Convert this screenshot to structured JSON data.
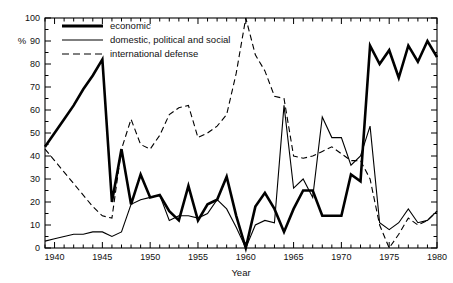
{
  "chart_data": {
    "type": "line",
    "title": "",
    "xlabel": "Year",
    "ylabel": "%",
    "xlim": [
      1939,
      1980
    ],
    "ylim": [
      0,
      100
    ],
    "grid": false,
    "legend_position": "top-left",
    "x_ticks": [
      1940,
      1945,
      1950,
      1955,
      1960,
      1965,
      1970,
      1975,
      1980
    ],
    "x_tick_labels": [
      "1940",
      "1945",
      "1950",
      "1955",
      "1960",
      "1965",
      "1970",
      "1975",
      "1980"
    ],
    "x_minor_step": 1,
    "y_ticks": [
      0,
      10,
      20,
      30,
      40,
      50,
      60,
      70,
      80,
      90,
      100
    ],
    "y_tick_labels": [
      "0",
      "10",
      "20",
      "30",
      "40",
      "50",
      "60",
      "70",
      "80",
      "90",
      "100"
    ],
    "series": [
      {
        "name": "economic",
        "style": "solid",
        "width": 2.6,
        "color": "#000000",
        "x": [
          1939,
          1940,
          1941,
          1942,
          1943,
          1944,
          1945,
          1946,
          1947,
          1948,
          1949,
          1950,
          1951,
          1952,
          1953,
          1954,
          1955,
          1956,
          1957,
          1958,
          1959,
          1960,
          1961,
          1962,
          1963,
          1964,
          1965,
          1966,
          1967,
          1968,
          1969,
          1970,
          1971,
          1972,
          1973,
          1974,
          1975,
          1976,
          1977,
          1978,
          1979,
          1980
        ],
        "y": [
          44,
          50,
          56,
          62,
          69,
          75,
          82,
          20,
          43,
          19,
          32,
          22,
          23,
          16,
          12,
          27,
          12,
          19,
          21,
          31,
          14,
          0,
          18,
          24,
          17,
          7,
          17,
          25,
          25,
          14,
          14,
          14,
          32,
          29,
          88,
          80,
          86,
          74,
          88,
          81,
          90,
          83
        ]
      },
      {
        "name": "domestic, political and social",
        "style": "solid",
        "width": 1.1,
        "color": "#000000",
        "x": [
          1939,
          1940,
          1941,
          1942,
          1943,
          1944,
          1945,
          1946,
          1947,
          1948,
          1949,
          1950,
          1951,
          1952,
          1953,
          1954,
          1955,
          1956,
          1957,
          1958,
          1959,
          1960,
          1961,
          1962,
          1963,
          1964,
          1965,
          1966,
          1967,
          1968,
          1969,
          1970,
          1971,
          1972,
          1973,
          1974,
          1975,
          1976,
          1977,
          1978,
          1979,
          1980
        ],
        "y": [
          3,
          4,
          5,
          6,
          6,
          7,
          7,
          5,
          7,
          19,
          21,
          22,
          23,
          12,
          14,
          14,
          13,
          15,
          21,
          17,
          9,
          0,
          10,
          12,
          11,
          62,
          26,
          30,
          22,
          57,
          48,
          48,
          36,
          40,
          53,
          11,
          8,
          11,
          17,
          11,
          12,
          16
        ]
      },
      {
        "name": "international defense",
        "style": "dashed",
        "width": 1.1,
        "color": "#000000",
        "x": [
          1939,
          1940,
          1941,
          1942,
          1943,
          1944,
          1945,
          1946,
          1947,
          1948,
          1949,
          1950,
          1951,
          1952,
          1953,
          1954,
          1955,
          1956,
          1957,
          1958,
          1959,
          1960,
          1961,
          1962,
          1963,
          1964,
          1965,
          1966,
          1967,
          1968,
          1969,
          1970,
          1971,
          1972,
          1973,
          1974,
          1975,
          1976,
          1977,
          1978,
          1979,
          1980
        ],
        "y": [
          43,
          38,
          33,
          28,
          23,
          18,
          14,
          13,
          43,
          56,
          45,
          43,
          49,
          58,
          61,
          62,
          48,
          50,
          53,
          58,
          76,
          100,
          84,
          77,
          66,
          65,
          40,
          39,
          40,
          42,
          44,
          41,
          38,
          38,
          30,
          10,
          0,
          6,
          13,
          10,
          12,
          16
        ]
      }
    ]
  },
  "legend": {
    "items": [
      {
        "label": "economic",
        "style": "solid-thick"
      },
      {
        "label": "domestic, political and social",
        "style": "solid-thin"
      },
      {
        "label": "international defense",
        "style": "dashed"
      }
    ]
  },
  "axes": {
    "y_axis_label": "%",
    "x_axis_label": "Year"
  }
}
